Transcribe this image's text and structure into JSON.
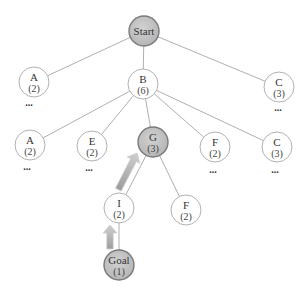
{
  "diagram": {
    "type": "search-tree",
    "colors": {
      "highlight_fill": "#b3b3b3",
      "highlight_stroke": "#777777",
      "arrow_fill": "#b0b0b0",
      "arrow_stroke": "#d0d0d0",
      "edge": "#9a9a9a"
    },
    "nodes": [
      {
        "id": "start",
        "label": "Start",
        "cost": "",
        "highlighted": true,
        "ellipsis": false
      },
      {
        "id": "a1",
        "label": "A",
        "cost": "(2)",
        "highlighted": false,
        "ellipsis": true
      },
      {
        "id": "b",
        "label": "B",
        "cost": "(6)",
        "highlighted": false,
        "ellipsis": false
      },
      {
        "id": "c1",
        "label": "C",
        "cost": "(3)",
        "highlighted": false,
        "ellipsis": true
      },
      {
        "id": "a2",
        "label": "A",
        "cost": "(2)",
        "highlighted": false,
        "ellipsis": true
      },
      {
        "id": "e",
        "label": "E",
        "cost": "(2)",
        "highlighted": false,
        "ellipsis": true
      },
      {
        "id": "g",
        "label": "G",
        "cost": "(3)",
        "highlighted": true,
        "ellipsis": false
      },
      {
        "id": "f1",
        "label": "F",
        "cost": "(2)",
        "highlighted": false,
        "ellipsis": true
      },
      {
        "id": "c2",
        "label": "C",
        "cost": "(3)",
        "highlighted": false,
        "ellipsis": true
      },
      {
        "id": "i",
        "label": "I",
        "cost": "(2)",
        "highlighted": false,
        "ellipsis": false
      },
      {
        "id": "f2",
        "label": "F",
        "cost": "(2)",
        "highlighted": false,
        "ellipsis": false
      },
      {
        "id": "goal",
        "label": "Goal",
        "cost": "(1)",
        "highlighted": true,
        "ellipsis": false
      }
    ],
    "edges": [
      [
        "start",
        "a1"
      ],
      [
        "start",
        "b"
      ],
      [
        "start",
        "c1"
      ],
      [
        "b",
        "a2"
      ],
      [
        "b",
        "e"
      ],
      [
        "b",
        "g"
      ],
      [
        "b",
        "f1"
      ],
      [
        "b",
        "c2"
      ],
      [
        "g",
        "i"
      ],
      [
        "g",
        "f2"
      ],
      [
        "i",
        "goal"
      ]
    ],
    "path_arrows": [
      {
        "from": "goal",
        "to": "i"
      },
      {
        "from": "i",
        "to": "g"
      }
    ],
    "ellipsis_text": "..."
  }
}
